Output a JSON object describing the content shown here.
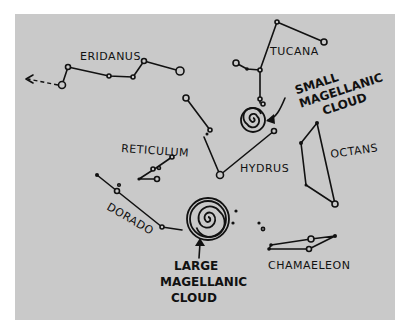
{
  "diagram": {
    "background_color": "#c9c9c9",
    "ink_color": "#111111",
    "labels": {
      "eridanus": "ERIDANUS",
      "tucana": "TUCANA",
      "small_magellanic_cloud": [
        "SMALL",
        "MAGELLANIC",
        "CLOUD"
      ],
      "octans": "OCTANS",
      "reticulum": "RETICULUM",
      "hydrus": "HYDRUS",
      "dorado": "DORADO",
      "large_magellanic_cloud": [
        "LARGE",
        "MAGELLANIC",
        "CLOUD"
      ],
      "chamaeleon": "CHAMAELEON"
    },
    "constellations": [
      {
        "name": "Eridanus",
        "note": "continues off-chart (dashed arrow)"
      },
      {
        "name": "Tucana"
      },
      {
        "name": "Hydrus"
      },
      {
        "name": "Octans"
      },
      {
        "name": "Reticulum"
      },
      {
        "name": "Dorado"
      },
      {
        "name": "Chamaeleon"
      }
    ],
    "galaxies": [
      {
        "name": "Small Magellanic Cloud",
        "icon": "spiral-icon"
      },
      {
        "name": "Large Magellanic Cloud",
        "icon": "spiral-icon"
      }
    ]
  }
}
